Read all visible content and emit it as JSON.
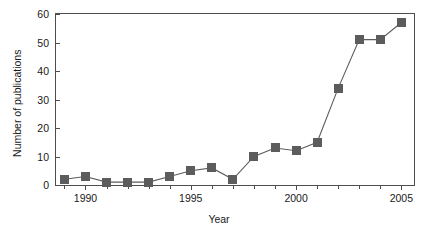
{
  "chart_data": {
    "type": "line",
    "title": "",
    "xlabel": "Year",
    "ylabel": "Number of publications",
    "xlim": [
      1988.6,
      2005.6
    ],
    "ylim": [
      0,
      60
    ],
    "grid": false,
    "legend": null,
    "marker": "square",
    "series_color": "#5c5c5c",
    "ytick_values": [
      0,
      10,
      20,
      30,
      40,
      50,
      60
    ],
    "ytick_labels": [
      "0",
      "10",
      "20",
      "30",
      "40",
      "50",
      "60"
    ],
    "xtick_values": [
      1989,
      1990,
      1991,
      1992,
      1993,
      1994,
      1995,
      1996,
      1997,
      1998,
      1999,
      2000,
      2001,
      2002,
      2003,
      2004,
      2005
    ],
    "xtick_labeled": [
      1990,
      1995,
      2000,
      2005
    ],
    "xtick_labels": [
      "1990",
      "1995",
      "2000",
      "2005"
    ],
    "x": [
      1989,
      1990,
      1991,
      1992,
      1993,
      1994,
      1995,
      1996,
      1997,
      1998,
      1999,
      2000,
      2001,
      2002,
      2003,
      2004,
      2005
    ],
    "values": [
      2,
      3,
      1,
      1,
      1,
      3,
      5,
      6,
      2,
      10,
      13,
      12,
      15,
      34,
      51,
      51,
      57
    ],
    "series": [
      {
        "name": "Number of publications",
        "x": [
          1989,
          1990,
          1991,
          1992,
          1993,
          1994,
          1995,
          1996,
          1997,
          1998,
          1999,
          2000,
          2001,
          2002,
          2003,
          2004,
          2005
        ],
        "values": [
          2,
          3,
          1,
          1,
          1,
          3,
          5,
          6,
          2,
          10,
          13,
          12,
          15,
          34,
          51,
          51,
          57
        ]
      }
    ]
  },
  "axes": {
    "y_title": "Number of publications",
    "x_title": "Year"
  }
}
